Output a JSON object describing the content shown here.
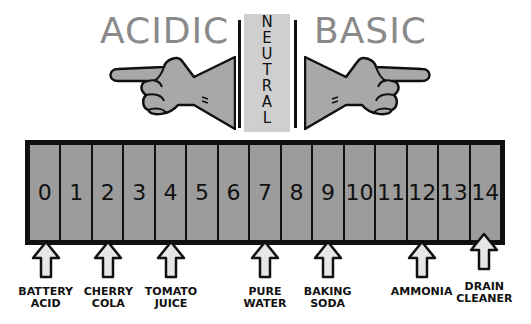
{
  "headings": {
    "acidic": "ACIDIC",
    "neutral": "NEUTRAL",
    "basic": "BASIC"
  },
  "scale": {
    "values": [
      "0",
      "1",
      "2",
      "3",
      "4",
      "5",
      "6",
      "7",
      "8",
      "9",
      "10",
      "11",
      "12",
      "13",
      "14"
    ]
  },
  "examples": [
    {
      "line1": "BATTERY",
      "line2": "ACID",
      "ph": 0
    },
    {
      "line1": "CHERRY",
      "line2": "COLA",
      "ph": 2
    },
    {
      "line1": "TOMATO",
      "line2": "JUICE",
      "ph": 4
    },
    {
      "line1": "PURE",
      "line2": "WATER",
      "ph": 7
    },
    {
      "line1": "BAKING",
      "line2": "SODA",
      "ph": 9
    },
    {
      "line1": "AMMONIA",
      "line2": "",
      "ph": 12
    },
    {
      "line1": "DRAIN",
      "line2": "CLEANER",
      "ph": 14
    }
  ],
  "colors": {
    "scale_fill": "#9c9c9c",
    "hand_fill": "#a8a8a8",
    "heading": "#8a8a8a",
    "neutral_band": "#cfcfcf",
    "arrow_fill": "#e6e6e6",
    "outline": "#111111"
  }
}
